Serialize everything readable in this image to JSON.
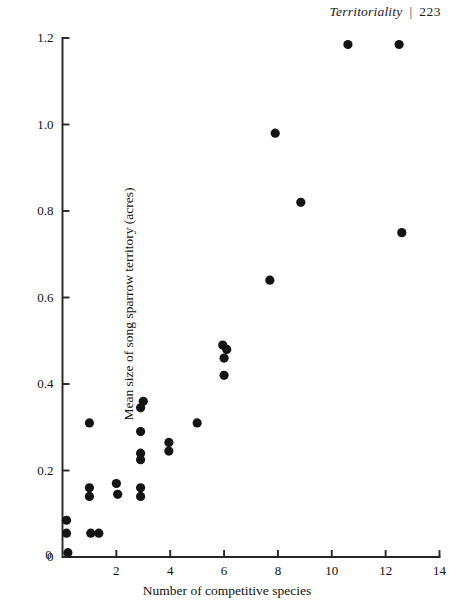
{
  "running_head": {
    "title": "Territoriality",
    "separator": "|",
    "page_number": "223"
  },
  "chart_data": {
    "type": "scatter",
    "title": "",
    "xlabel": "Number of competitive species",
    "ylabel": "Mean size of song sparrow territory (acres)",
    "xlim": [
      0,
      14
    ],
    "ylim": [
      0,
      1.2
    ],
    "xticks": [
      0,
      2,
      4,
      6,
      8,
      10,
      12,
      14
    ],
    "xtick_labels": [
      "0",
      "2",
      "4",
      "6",
      "8",
      "10",
      "12",
      "14"
    ],
    "yticks": [
      0,
      0.2,
      0.4,
      0.6,
      0.8,
      1.0,
      1.2
    ],
    "ytick_labels": [
      "0",
      "0.2",
      "0.4",
      "0.6",
      "0.8",
      "1.0",
      "1.2"
    ],
    "grid": false,
    "legend": null,
    "marker": "filled-circle",
    "marker_color": "#141414",
    "marker_size_px": 4.6,
    "points": [
      {
        "x": 0.15,
        "y": 0.085
      },
      {
        "x": 0.15,
        "y": 0.055
      },
      {
        "x": 0.2,
        "y": 0.01
      },
      {
        "x": 1.0,
        "y": 0.31
      },
      {
        "x": 1.0,
        "y": 0.16
      },
      {
        "x": 1.0,
        "y": 0.14
      },
      {
        "x": 1.05,
        "y": 0.055
      },
      {
        "x": 1.35,
        "y": 0.055
      },
      {
        "x": 2.0,
        "y": 0.17
      },
      {
        "x": 2.05,
        "y": 0.145
      },
      {
        "x": 3.0,
        "y": 0.36
      },
      {
        "x": 2.9,
        "y": 0.345
      },
      {
        "x": 2.9,
        "y": 0.29
      },
      {
        "x": 2.9,
        "y": 0.24
      },
      {
        "x": 2.9,
        "y": 0.225
      },
      {
        "x": 2.9,
        "y": 0.16
      },
      {
        "x": 2.9,
        "y": 0.14
      },
      {
        "x": 3.95,
        "y": 0.265
      },
      {
        "x": 3.95,
        "y": 0.245
      },
      {
        "x": 5.0,
        "y": 0.31
      },
      {
        "x": 5.95,
        "y": 0.49
      },
      {
        "x": 6.1,
        "y": 0.48
      },
      {
        "x": 6.0,
        "y": 0.46
      },
      {
        "x": 6.0,
        "y": 0.42
      },
      {
        "x": 7.7,
        "y": 0.64
      },
      {
        "x": 7.9,
        "y": 0.98
      },
      {
        "x": 8.85,
        "y": 0.82
      },
      {
        "x": 10.6,
        "y": 1.185
      },
      {
        "x": 12.5,
        "y": 1.185
      },
      {
        "x": 12.6,
        "y": 0.75
      }
    ]
  }
}
